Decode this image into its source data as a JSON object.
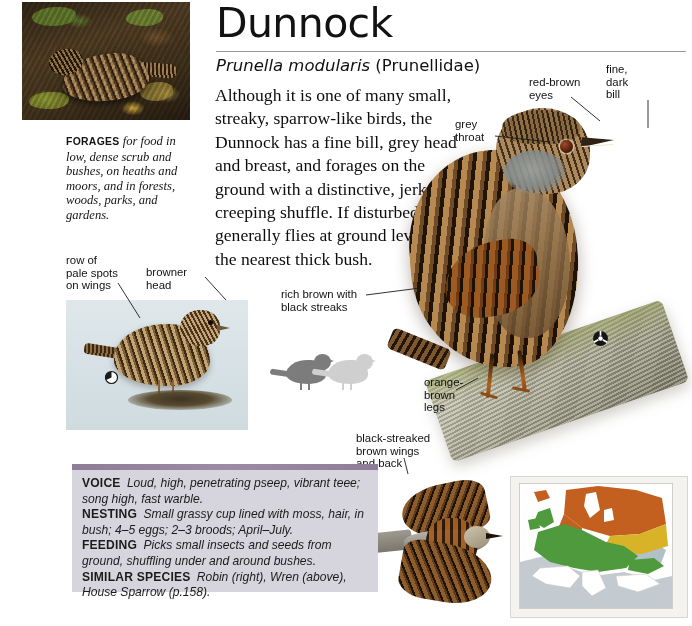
{
  "header": {
    "common_name": "Dunnock",
    "scientific_name": "Prunella modularis",
    "family": "(Prunellidae)"
  },
  "intro_text": "Although it is one of many small, streaky, sparrow-like birds, the Dunnock has a fine bill, grey head and breast, and forages on the ground with a distinctive, jerky, creeping shuffle. If disturbed, it generally flies at ground level into the nearest thick bush.",
  "photo_caption": {
    "lead": "FORAGES",
    "body": "for food in low, dense scrub and bushes, on heaths and moors, and in forests, woods, parks, and gardens."
  },
  "annotations": [
    {
      "id": "red-brown-eyes",
      "text": "red-brown\neyes"
    },
    {
      "id": "fine-dark-bill",
      "text": "fine,\ndark\nbill"
    },
    {
      "id": "grey-throat",
      "text": "grey\nthroat"
    },
    {
      "id": "row-of-pale-spots-on-wings",
      "text": "row of\npale spots\non wings"
    },
    {
      "id": "browner-head",
      "text": "browner\nhead"
    },
    {
      "id": "rich-brown-with-black-streaks",
      "text": "rich brown with\nblack streaks"
    },
    {
      "id": "orange-brown-legs",
      "text": "orange-\nbrown\nlegs"
    },
    {
      "id": "black-streaked-brown-wings-and-back",
      "text": "black-streaked\nbrown wings\nand back"
    }
  ],
  "info_box": {
    "entries": [
      {
        "key": "VOICE",
        "value": "Loud, high, penetrating pseep, vibrant teee; song high, fast warble."
      },
      {
        "key": "NESTING",
        "value": "Small grassy cup lined with moss, hair, in bush; 4–5 eggs; 2–3 broods; April–July."
      },
      {
        "key": "FEEDING",
        "value": "Picks small insects and seeds from ground, shuffling under and around bushes."
      },
      {
        "key": "SIMILAR SPECIES",
        "value": "Robin (right), Wren (above), House Sparrow (p.158)."
      }
    ]
  },
  "map": {
    "region": "Europe",
    "legend": [
      {
        "label": "resident",
        "color": "#4f9a3c"
      },
      {
        "label": "summer",
        "color": "#c4601f"
      },
      {
        "label": "winter",
        "color": "#d8b327"
      },
      {
        "label": "sea",
        "color": "#9aa8b4"
      }
    ]
  },
  "colors": {
    "info_box_background": "#d6d5dd",
    "info_box_topbar": "#8d7d96",
    "juvenile_panel": "#d9e3e7",
    "text": "#111111"
  }
}
